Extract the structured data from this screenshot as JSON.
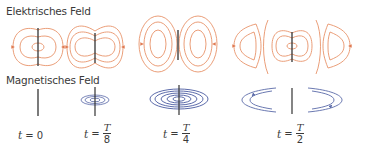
{
  "headings": {
    "electric": "Elektrisches Feld",
    "magnetic": "Magnetisches Feld"
  },
  "colors": {
    "electric_field_lines": "#e8936a",
    "magnetic_field_lines": "#5a6aa8",
    "antenna": "#333333",
    "text": "#3a3a3a"
  },
  "time_labels": [
    {
      "var": "t",
      "eq": "=",
      "value": "0"
    },
    {
      "var": "t",
      "eq": "=",
      "numerator": "T",
      "denominator": "8"
    },
    {
      "var": "t",
      "eq": "=",
      "numerator": "T",
      "denominator": "4"
    },
    {
      "var": "t",
      "eq": "=",
      "numerator": "T",
      "denominator": "2"
    }
  ],
  "panels": [
    {
      "time": "t = 0",
      "electric": "closed field loops around dipole",
      "magnetic": "no field (antenna only)"
    },
    {
      "time": "t = T/8",
      "electric": "widening field loops",
      "magnetic": "small concentric rings"
    },
    {
      "time": "t = T/4",
      "electric": "detached closed loops on both sides",
      "magnetic": "large concentric rings"
    },
    {
      "time": "t = T/2",
      "electric": "loops moving away, new loops forming",
      "magnetic": "rings detached, moving outward"
    }
  ]
}
